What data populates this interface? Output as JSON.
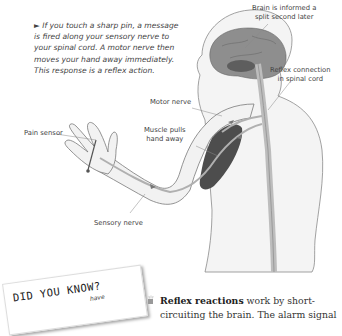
{
  "intro": {
    "bullet": "►",
    "text": "If you touch a sharp pin, a message is fired along your sensory nerve to your spinal cord. A motor nerve then moves your hand away immediately. This response is a reflex action."
  },
  "labels": {
    "brain": "Brain is informed a split second later",
    "brain_line1": "Brain is informed a",
    "brain_line2": "split second later",
    "reflex_line1": "Reflex connection",
    "reflex_line2": "in spinal cord",
    "motor_nerve": "Motor nerve",
    "muscle_line1": "Muscle pulls",
    "muscle_line2": "hand away",
    "pain_sensor": "Pain sensor",
    "sensory_nerve": "Sensory nerve"
  },
  "did_you_know": {
    "title": "DID YOU KNOW?",
    "text_partial": "have"
  },
  "fact": {
    "icon": "hand-icon",
    "bold": "Reflex reactions",
    "rest": " work by short-circuiting the brain. The alarm signal"
  },
  "colors": {
    "skin_fill": "#f2f2f2",
    "outline": "#7a7a7a",
    "brain": "#8a8a8a",
    "muscle": "#4a4a4a",
    "nerve": "#b5b5b5"
  }
}
